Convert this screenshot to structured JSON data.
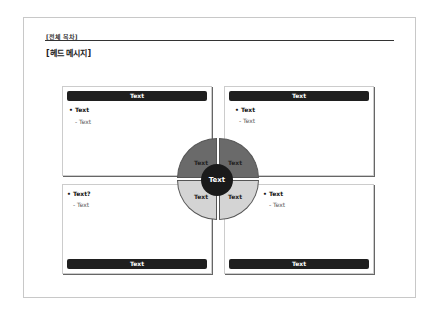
{
  "header": {
    "breadcrumb": "[전체 목차]",
    "head_message": "[헤드 메시지]"
  },
  "boxes": [
    {
      "title": "Text",
      "bullet": "• Text",
      "sub": "- Text"
    },
    {
      "title": "Text",
      "bullet": "• Text",
      "sub": "- Text"
    },
    {
      "title": "Text",
      "bullet": "• Text?",
      "sub": "- Text"
    },
    {
      "title": "Text",
      "bullet": "• Text",
      "sub": "- Text"
    }
  ],
  "diagram": {
    "center": "Text",
    "quadrants": [
      "Text",
      "Text",
      "Text",
      "Text"
    ],
    "colors": {
      "top": "#6a6a6a",
      "bottom": "#d4d4d4",
      "center": "#1a1a1a"
    }
  }
}
